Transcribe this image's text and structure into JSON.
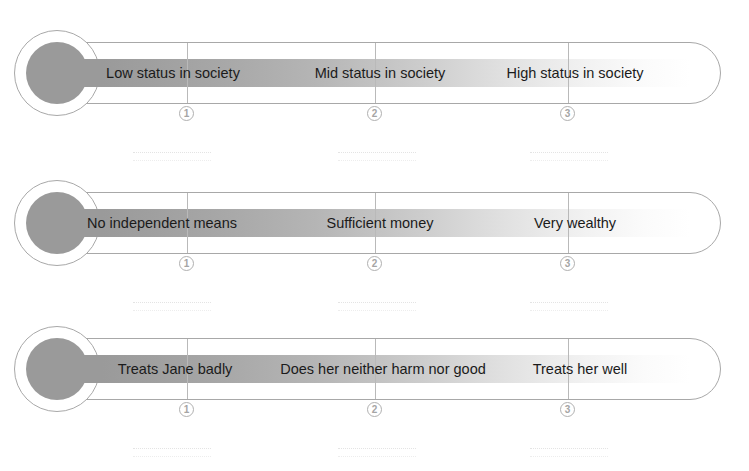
{
  "worksheet": {
    "title": "Character rating scales worksheet",
    "scale_count": 3,
    "colors": {
      "bulb_fill": "#9a9a9a",
      "outline": "#a8a8a8",
      "gradient_start": "#9a9a9a",
      "gradient_end": "#ffffff",
      "text": "#1b1b1b",
      "marker": "#a5a5a5",
      "background": "#ffffff"
    },
    "markers": [
      "1",
      "2",
      "3"
    ],
    "marker_glyphs": [
      "❶",
      "❷",
      "❸"
    ],
    "scales": [
      {
        "id": "status",
        "labels": [
          "Low status in society",
          "Mid status in society",
          "High status in society"
        ]
      },
      {
        "id": "wealth",
        "labels": [
          "No independent means",
          "Sufficient money",
          "Very wealthy"
        ]
      },
      {
        "id": "treatment-of-jane",
        "labels": [
          "Treats Jane badly",
          "Does her neither harm nor good",
          "Treats her well"
        ]
      }
    ]
  }
}
